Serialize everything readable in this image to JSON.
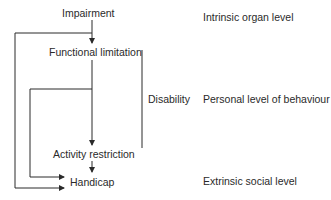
{
  "diagram": {
    "nodes": [
      {
        "id": "impairment",
        "label": "Impairment"
      },
      {
        "id": "functional_limitation",
        "label": "Functional limitation"
      },
      {
        "id": "activity_restriction",
        "label": "Activity restriction"
      },
      {
        "id": "handicap",
        "label": "Handicap"
      }
    ],
    "group": {
      "label": "Disability",
      "spans": [
        "functional_limitation",
        "activity_restriction"
      ]
    },
    "levels": [
      {
        "label": "Intrinsic organ level"
      },
      {
        "label": "Personal level of behaviour"
      },
      {
        "label": "Extrinsic social level"
      }
    ],
    "edges": [
      {
        "from": "impairment",
        "to": "functional_limitation"
      },
      {
        "from": "functional_limitation",
        "to": "activity_restriction"
      },
      {
        "from": "activity_restriction",
        "to": "handicap"
      },
      {
        "from": "impairment",
        "to": "handicap"
      },
      {
        "from": "functional_limitation",
        "to": "handicap"
      }
    ],
    "colors": {
      "line": "#2a2a2a",
      "text": "#2a2a2a",
      "background": "#ffffff"
    }
  }
}
